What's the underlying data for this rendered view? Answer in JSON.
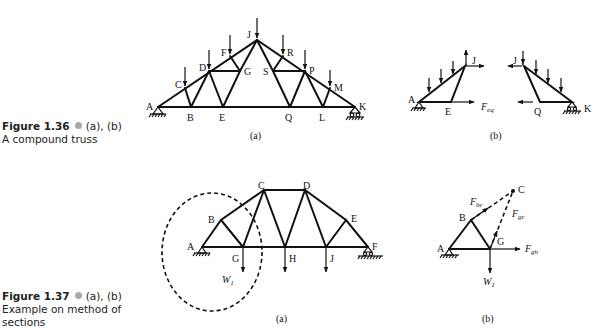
{
  "figures": [
    {
      "number": "Figure 1.36",
      "parts": "(a), (b)",
      "caption": "A compound truss",
      "panel_a": {
        "label": "(a)",
        "nodes": [
          "A",
          "B",
          "C",
          "D",
          "E",
          "F",
          "G",
          "J",
          "K",
          "L",
          "M",
          "P",
          "Q",
          "R",
          "S"
        ],
        "loaded_nodes": [
          "C",
          "D",
          "F",
          "J",
          "R",
          "P",
          "M"
        ],
        "supports": {
          "A": "pin",
          "K": "roller"
        }
      },
      "panel_b": {
        "label": "(b)",
        "left_part": {
          "nodes": [
            "A",
            "E",
            "J"
          ],
          "force_label": "F",
          "force_sub": "eq"
        },
        "right_part": {
          "nodes": [
            "J",
            "Q",
            "K"
          ]
        }
      }
    },
    {
      "number": "Figure 1.37",
      "parts": "(a), (b)",
      "caption": "Example on method of sections",
      "panel_a": {
        "label": "(a)",
        "nodes": [
          "A",
          "B",
          "C",
          "D",
          "E",
          "F",
          "G",
          "H",
          "J"
        ],
        "load_label": "W",
        "load_sub": "1",
        "supports": {
          "A": "pin",
          "F": "roller"
        }
      },
      "panel_b": {
        "label": "(b)",
        "nodes": [
          "A",
          "B",
          "G",
          "C"
        ],
        "forces": [
          {
            "name": "F",
            "sub": "bc"
          },
          {
            "name": "F",
            "sub": "gc"
          },
          {
            "name": "F",
            "sub": "gh"
          }
        ],
        "load_label": "W",
        "load_sub": "1"
      }
    }
  ]
}
